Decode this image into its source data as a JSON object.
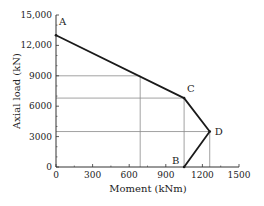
{
  "chart_data": {
    "type": "line",
    "title": "",
    "xlabel": "Moment (kNm)",
    "ylabel": "Axial load (kN)",
    "xlim": [
      0,
      1500
    ],
    "ylim": [
      0,
      15000
    ],
    "x_ticks": [
      "0",
      "300",
      "600",
      "900",
      "1200",
      "1500"
    ],
    "y_ticks": [
      "0",
      "3000",
      "6000",
      "9000",
      "12,000",
      "15,000"
    ],
    "grid": false,
    "series": [
      {
        "name": "Interaction diagram",
        "points": [
          {
            "label": "A",
            "x": 0,
            "y": 13000
          },
          {
            "label": "C",
            "x": 1050,
            "y": 6800
          },
          {
            "label": "D",
            "x": 1260,
            "y": 3500
          },
          {
            "label": "B",
            "x": 1050,
            "y": 0
          }
        ]
      }
    ],
    "reference_lines": [
      {
        "type": "horizontal",
        "y": 9000,
        "x_end": 690
      },
      {
        "type": "vertical",
        "x": 690,
        "y_end": 9000
      },
      {
        "type": "horizontal",
        "y": 6800,
        "x_end": 1050
      },
      {
        "type": "vertical",
        "x": 1050,
        "y_end": 6800
      },
      {
        "type": "horizontal",
        "y": 3500,
        "x_end": 1260
      },
      {
        "type": "vertical",
        "x": 1260,
        "y_end": 3500
      }
    ]
  }
}
